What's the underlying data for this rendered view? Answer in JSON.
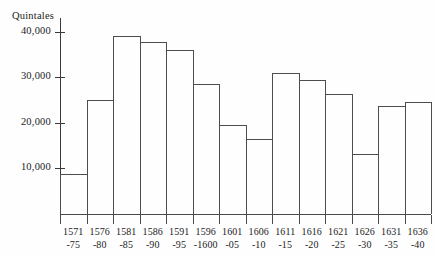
{
  "chart_data": {
    "type": "bar",
    "title": "",
    "subtitle": "",
    "xlabel": "",
    "ylabel": "Quintales",
    "ylim": [
      0,
      43000
    ],
    "grid": false,
    "legend": "none",
    "y_ticks": [
      "10,000",
      "20,000",
      "30,000",
      "40,000"
    ],
    "y_tick_values": [
      10000,
      20000,
      30000,
      40000
    ],
    "categories": [
      "1571-75",
      "1576-80",
      "1581-85",
      "1586-90",
      "1591-95",
      "1596-1600",
      "1601-05",
      "1606-10",
      "1611-15",
      "1616-20",
      "1621-25",
      "1626-30",
      "1631-35",
      "1636-40"
    ],
    "category_lines": [
      {
        "start": "1571",
        "end": "-75"
      },
      {
        "start": "1576",
        "end": "-80"
      },
      {
        "start": "1581",
        "end": "-85"
      },
      {
        "start": "1586",
        "end": "-90"
      },
      {
        "start": "1591",
        "end": "-95"
      },
      {
        "start": "1596",
        "end": "-1600"
      },
      {
        "start": "1601",
        "end": "-05"
      },
      {
        "start": "1606",
        "end": "-10"
      },
      {
        "start": "1611",
        "end": "-15"
      },
      {
        "start": "1616",
        "end": "-20"
      },
      {
        "start": "1621",
        "end": "-25"
      },
      {
        "start": "1626",
        "end": "-30"
      },
      {
        "start": "1631",
        "end": "-35"
      },
      {
        "start": "1636",
        "end": "-40"
      }
    ],
    "values": [
      8700,
      25000,
      39000,
      37800,
      36000,
      28500,
      19500,
      16500,
      31000,
      29300,
      26300,
      13200,
      23800,
      24500
    ],
    "colors": {
      "bar_outline": "#4d4d4d",
      "bar_fill": "transparent",
      "axis": "#3a3a3a",
      "text": "#1c1c1c",
      "background": "#fefefe"
    }
  }
}
